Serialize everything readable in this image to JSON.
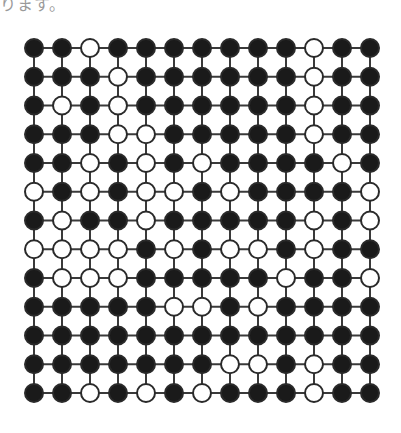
{
  "caption_fragment": "ります。",
  "lattice": {
    "rows": 13,
    "cols": 13,
    "origin_x": 34,
    "origin_y": 48,
    "step_x": 28,
    "step_y": 28.75,
    "radius": 9,
    "colors": {
      "black": "#1a1a1a",
      "white": "#ffffff",
      "line": "#3a3a3a",
      "stroke": "#2a2a2a"
    },
    "grid": [
      "BBWBBBBBBBWBB",
      "BBBWBBBBBBWBB",
      "BWBWBBBBBBWBB",
      "BBBWWBBBBBWBB",
      "BBWBWBWBBBBWB",
      "WBWBWWBWBBBBW",
      "BWBBWBBBBBWBW",
      "WWWWBWBWWBWBB",
      "BWWWBBBBBWBBW",
      "BBBBBWWBWBBBB",
      "BBBBBBBBBBBBB",
      "BBBBBBBWWBWBB",
      "BBWBWBWBBBWBB"
    ]
  }
}
